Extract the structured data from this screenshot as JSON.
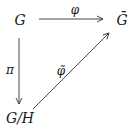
{
  "diagram": {
    "type": "commutative-diagram",
    "nodes": {
      "top_left": {
        "text": "G"
      },
      "top_right": {
        "text": "Ḡ"
      },
      "bottom_left": {
        "text": "G/H"
      }
    },
    "arrows": {
      "horizontal": {
        "from": "G",
        "to": "Ḡ",
        "label": "φ"
      },
      "vertical": {
        "from": "G",
        "to": "G/H",
        "label": "π"
      },
      "diagonal": {
        "from": "G/H",
        "to": "Ḡ",
        "label": "φ̃"
      }
    },
    "colors": {
      "stroke": "#333333",
      "text": "#1a1a1a",
      "background": "#ffffff"
    }
  }
}
